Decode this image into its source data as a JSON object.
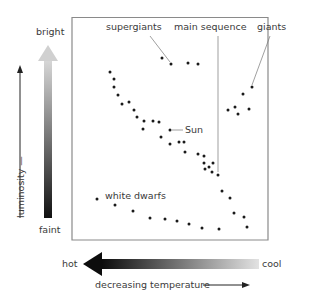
{
  "diagram": {
    "y_axis": {
      "label": "luminosity",
      "top_label": "bright",
      "bottom_label": "faint"
    },
    "x_axis": {
      "left_label": "hot",
      "right_label": "cool",
      "direction_label": "decreasing temperature"
    },
    "annotations": {
      "supergiants": "supergiants",
      "main_sequence": "main sequence",
      "giants": "giants",
      "sun": "Sun",
      "white_dwarfs": "white dwarfs"
    },
    "colors": {
      "dot": "#1a1a1a",
      "frame": "#8a8a8a",
      "gradient_dark": "#111111",
      "gradient_light": "#dcdcdc"
    },
    "stars": {
      "supergiants": [
        [
          162,
          58
        ],
        [
          171,
          64
        ],
        [
          188,
          63
        ],
        [
          198,
          64
        ]
      ],
      "giants": [
        [
          252,
          87
        ],
        [
          243,
          94
        ],
        [
          228,
          110
        ],
        [
          235,
          107
        ],
        [
          238,
          114
        ],
        [
          249,
          109
        ]
      ],
      "main_sequence": [
        [
          110,
          72
        ],
        [
          114,
          79
        ],
        [
          114,
          87
        ],
        [
          118,
          95
        ],
        [
          122,
          104
        ],
        [
          129,
          102
        ],
        [
          134,
          110
        ],
        [
          137,
          117
        ],
        [
          144,
          121
        ],
        [
          143,
          129
        ],
        [
          153,
          121
        ],
        [
          159,
          122
        ],
        [
          170,
          130
        ],
        [
          161,
          137
        ],
        [
          170,
          144
        ],
        [
          179,
          142
        ],
        [
          184,
          142
        ],
        [
          185,
          152
        ],
        [
          198,
          154
        ],
        [
          204,
          156
        ],
        [
          204,
          163
        ],
        [
          209,
          167
        ],
        [
          213,
          163
        ],
        [
          205,
          169
        ],
        [
          212,
          172
        ],
        [
          218,
          175
        ],
        [
          222,
          191
        ],
        [
          230,
          198
        ],
        [
          234,
          213
        ],
        [
          244,
          217
        ],
        [
          247,
          227
        ]
      ],
      "white_dwarfs": [
        [
          97,
          199
        ],
        [
          115,
          205
        ],
        [
          133,
          211
        ],
        [
          150,
          218
        ],
        [
          165,
          219
        ],
        [
          177,
          221
        ],
        [
          189,
          224
        ],
        [
          202,
          228
        ],
        [
          219,
          229
        ]
      ]
    }
  }
}
